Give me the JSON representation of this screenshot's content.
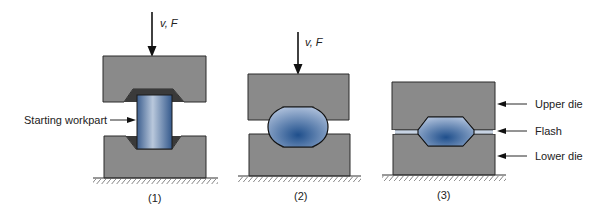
{
  "figure": {
    "panels": [
      {
        "id": "1",
        "caption": "(1)",
        "force_label": "v, F",
        "callout": "Starting workpart"
      },
      {
        "id": "2",
        "caption": "(2)",
        "force_label": "v, F"
      },
      {
        "id": "3",
        "caption": "(3)",
        "callouts": [
          "Upper die",
          "Flash",
          "Lower die"
        ]
      }
    ]
  },
  "colors": {
    "die": "#8a8a8a",
    "die_outline": "#2a2a2a",
    "cavity": "#3a3a3a",
    "workpart_light": "#a9bfdc",
    "workpart_dark": "#1f4f8c",
    "ground_hatch": "#555555"
  }
}
